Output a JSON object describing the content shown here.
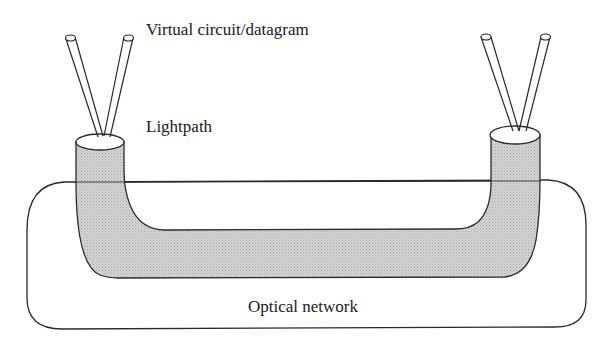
{
  "diagram": {
    "labels": {
      "virtual_circuit": "Virtual circuit/datagram",
      "lightpath": "Lightpath",
      "optical_network": "Optical network"
    },
    "colors": {
      "stroke": "#2a2a2a",
      "lightpath_fill": "#c8c8c8",
      "background": "#ffffff"
    },
    "nodes": [
      {
        "id": "lightpath",
        "kind": "tube",
        "label": "Lightpath"
      },
      {
        "id": "optical-network",
        "kind": "rounded-rectangle",
        "label": "Optical network"
      },
      {
        "id": "left-endpoint",
        "kind": "tube-end",
        "fibers": 2
      },
      {
        "id": "right-endpoint",
        "kind": "tube-end",
        "fibers": 2
      }
    ],
    "edges": [
      {
        "from": "left-endpoint",
        "to": "right-endpoint",
        "via": "lightpath"
      }
    ]
  }
}
